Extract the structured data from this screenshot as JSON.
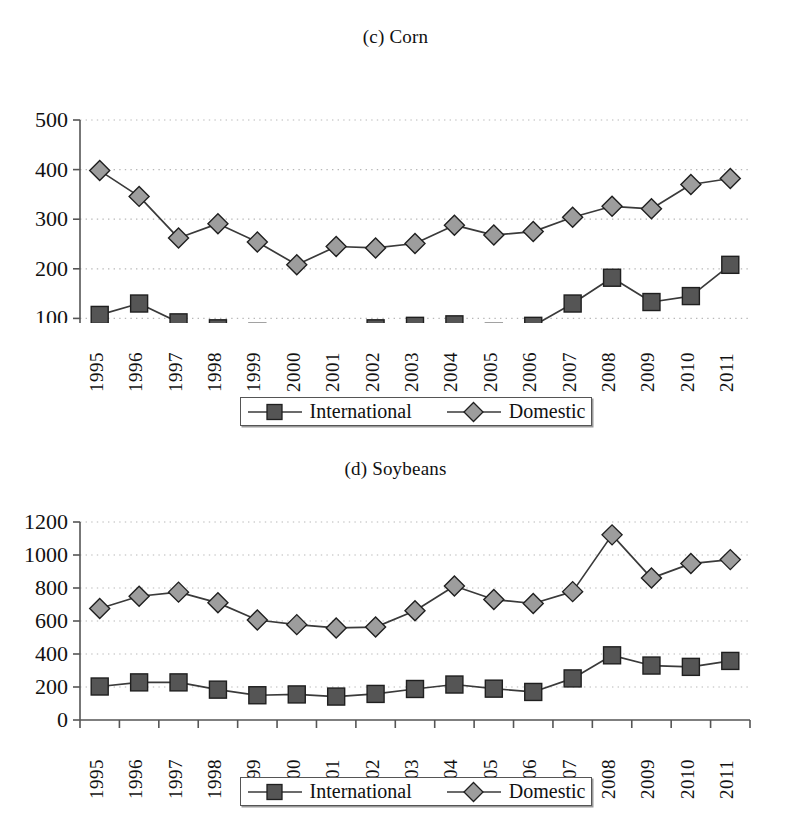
{
  "figure": {
    "panels": [
      {
        "key": "corn",
        "title": "(c) Corn",
        "legend": {
          "international_label": "International",
          "domestic_label": "Domestic"
        }
      },
      {
        "key": "soybeans",
        "title": "(d) Soybeans",
        "legend": {
          "international_label": "International",
          "domestic_label": "Domestic"
        }
      }
    ]
  },
  "colors": {
    "international_marker_fill": "#555555",
    "domestic_marker_fill": "#9d9d9d",
    "marker_stroke": "#1f1f1f",
    "line": "#3a3a3a",
    "axis": "#555555",
    "gridline": "#b8b8b8",
    "text": "#111111",
    "background": "#ffffff"
  },
  "chart_data": [
    {
      "type": "line",
      "title": "(c) Corn",
      "xlabel": "",
      "ylabel": "",
      "grid": true,
      "legend_position": "bottom",
      "ylim": [
        0,
        500
      ],
      "yticks": [
        0,
        100,
        200,
        300,
        400,
        500
      ],
      "ytick_labels": [
        "0",
        "100",
        "200",
        "300",
        "400",
        "500"
      ],
      "categories": [
        "1995",
        "1996",
        "1997",
        "1998",
        "1999",
        "2000",
        "2001",
        "2002",
        "2003",
        "2004",
        "2005",
        "2006",
        "2007",
        "2008",
        "2009",
        "2010",
        "2011"
      ],
      "series": [
        {
          "name": "International",
          "marker": "square",
          "values": [
            107,
            130,
            92,
            80,
            73,
            70,
            72,
            80,
            85,
            88,
            73,
            85,
            130,
            182,
            133,
            145,
            208
          ]
        },
        {
          "name": "Domestic",
          "marker": "diamond",
          "values": [
            398,
            346,
            262,
            291,
            254,
            208,
            245,
            242,
            251,
            288,
            268,
            275,
            304,
            326,
            321,
            370,
            382
          ]
        }
      ]
    },
    {
      "type": "line",
      "title": "(d) Soybeans",
      "xlabel": "",
      "ylabel": "",
      "grid": true,
      "legend_position": "bottom",
      "ylim": [
        0,
        1200
      ],
      "yticks": [
        0,
        200,
        400,
        600,
        800,
        1000,
        1200
      ],
      "ytick_labels": [
        "0",
        "200",
        "400",
        "600",
        "800",
        "1000",
        "1200"
      ],
      "categories": [
        "1995",
        "1996",
        "1997",
        "1998",
        "1999",
        "2000",
        "2001",
        "2002",
        "2003",
        "2004",
        "2005",
        "2006",
        "2007",
        "2008",
        "2009",
        "2010",
        "2011"
      ],
      "series": [
        {
          "name": "International",
          "marker": "square",
          "values": [
            203,
            228,
            228,
            184,
            150,
            155,
            142,
            158,
            188,
            215,
            190,
            170,
            252,
            392,
            330,
            322,
            358
          ]
        },
        {
          "name": "Domestic",
          "marker": "diamond",
          "values": [
            676,
            750,
            775,
            710,
            606,
            578,
            558,
            563,
            662,
            812,
            730,
            706,
            778,
            1122,
            860,
            948,
            972
          ]
        }
      ]
    }
  ]
}
